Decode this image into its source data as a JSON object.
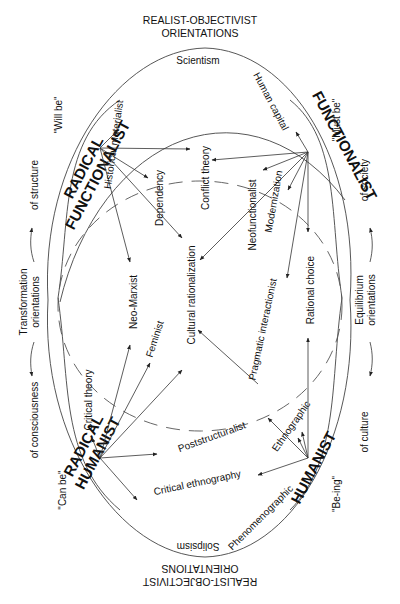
{
  "headers": {
    "top": [
      "REALIST-OBJECTIVIST",
      "ORIENTATIONS"
    ],
    "bottom": [
      "REALIST-OBJECTIVIST",
      "ORIENTATIONS"
    ]
  },
  "poles": {
    "top": "Scientism",
    "bottom": "Solipsism"
  },
  "paradigms": {
    "radical_functionalist": [
      "RADICAL",
      "FUNCTIONALIST"
    ],
    "functionalist": "FUNCTIONALIST",
    "radical_humanist": [
      "RADICAL",
      "HUMANIST"
    ],
    "humanist": "HUMANIST"
  },
  "modalities": {
    "will_be": "\"Will be\"",
    "must_be": "\"Must be\"",
    "can_be": "\"Can be\"",
    "be_ing": "\"Be-ing\""
  },
  "side_labels": {
    "of_structure": "of structure",
    "of_society": "of society",
    "of_consciousness": "of consciousness",
    "of_culture": "of culture",
    "transformation": [
      "Transformation",
      "orientations"
    ],
    "equilibrium": [
      "Equilibrium",
      "orientations"
    ]
  },
  "theories": {
    "human_capital": "Human capital",
    "historical_materialist": "Historical materialist",
    "dependency": "Dependency",
    "conflict_theory": "Conflict theory",
    "neofunctionalist": "Neofunctionalist",
    "modernization": "Modernization",
    "neo_marxist": "Neo-Marxist",
    "cultural_rationalization": "Cultural rationalization",
    "rational_choice": "Rational choice",
    "feminist": "Feminist",
    "pragmatic_interactionist": "Pragmatic interactionist",
    "critical_theory": "Critical theory",
    "poststructuralist": "Poststructuralist",
    "ethnographic": "Ethnographic",
    "critical_ethnography": "Critical ethnography",
    "phenomenographic": "Phenomenographic"
  }
}
